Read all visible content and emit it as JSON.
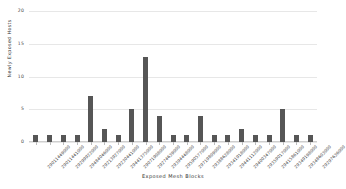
{
  "chart_data": {
    "type": "bar",
    "title": "",
    "xlabel": "Exposed Mesh Blocks",
    "ylabel": "Newly Exposed Hosts",
    "ylim": [
      0,
      20
    ],
    "yticks": [
      0,
      5,
      10,
      15,
      20
    ],
    "ytick_labels": [
      "0",
      "5",
      "10",
      "15",
      "20"
    ],
    "grid": true,
    "legend": "none",
    "bar_color": "#565656",
    "grid_color": "#e7e7e7",
    "background_color": "#ffffff",
    "categories": [
      "29011449000",
      "29011441000",
      "29299922000",
      "29484046000",
      "29213927000",
      "29230441000",
      "29441375000",
      "29071908000",
      "29274639000",
      "29394448000",
      "29590577000",
      "29719809000",
      "29388628000",
      "29341918000",
      "29441112000",
      "29400347000",
      "29359017000",
      "29415861000",
      "29349198000",
      "29348603000",
      "29297636000"
    ],
    "values": [
      1,
      1,
      1,
      1,
      7,
      2,
      1,
      5,
      13,
      4,
      1,
      1,
      4,
      1,
      1,
      2,
      1,
      1,
      5,
      1,
      1
    ]
  }
}
